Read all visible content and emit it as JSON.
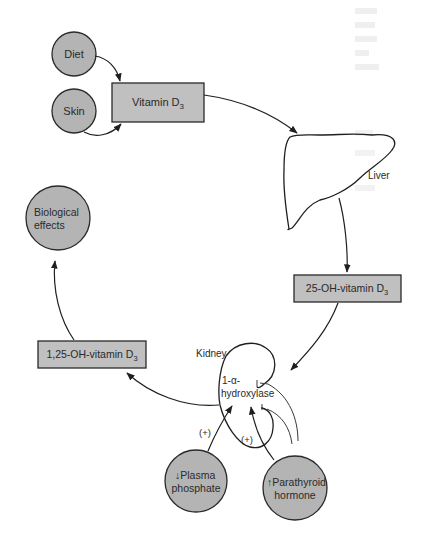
{
  "diagram": {
    "type": "metabolic-pathway",
    "nodes": {
      "diet": {
        "label": "Diet",
        "shape": "circle"
      },
      "skin": {
        "label": "Skin",
        "shape": "circle"
      },
      "vitamin_d3": {
        "label": "Vitamin D",
        "subscript": "3",
        "shape": "box"
      },
      "liver": {
        "label": "Liver",
        "shape": "organ"
      },
      "oh25_vitamin_d3": {
        "label": "25-OH-vitamin D",
        "subscript": "3",
        "shape": "box"
      },
      "kidney": {
        "label": "Kidney",
        "shape": "organ"
      },
      "hydroxylase": {
        "line1": "1-α-",
        "line2": "hydroxylase"
      },
      "oh125_vitamin_d3": {
        "label": "1,25-OH-vitamin D",
        "subscript": "3",
        "shape": "box"
      },
      "biological_effects": {
        "line1": "Biological",
        "line2": "effects",
        "shape": "circle"
      },
      "plasma_phosphate": {
        "arrow": "↓",
        "line1": "Plasma",
        "line2": "phosphate",
        "shape": "circle"
      },
      "parathyroid_hormone": {
        "arrow": "↑",
        "line1": "Parathyroid",
        "line2": "hormone",
        "shape": "circle"
      }
    },
    "modifiers": {
      "phosphate_effect": "(+)",
      "pth_effect": "(+)"
    },
    "edges": [
      {
        "from": "Diet",
        "to": "Vitamin D3"
      },
      {
        "from": "Skin",
        "to": "Vitamin D3"
      },
      {
        "from": "Vitamin D3",
        "to": "Liver"
      },
      {
        "from": "Liver",
        "to": "25-OH-vitamin D3"
      },
      {
        "from": "25-OH-vitamin D3",
        "to": "Kidney"
      },
      {
        "from": "Kidney",
        "to": "1,25-OH-vitamin D3"
      },
      {
        "from": "1,25-OH-vitamin D3",
        "to": "Biological effects"
      },
      {
        "from": "Plasma phosphate (decreased)",
        "to": "1-α-hydroxylase",
        "effect": "(+)"
      },
      {
        "from": "Parathyroid hormone (increased)",
        "to": "1-α-hydroxylase",
        "effect": "(+)"
      },
      {
        "from": "feedback",
        "to": "1-α-hydroxylase",
        "effect": "inhibition"
      }
    ],
    "colors": {
      "node_fill": "#b4b4b4",
      "box_fill": "#c0c0c0",
      "stroke": "#2a2a2a",
      "background": "#ffffff"
    }
  }
}
